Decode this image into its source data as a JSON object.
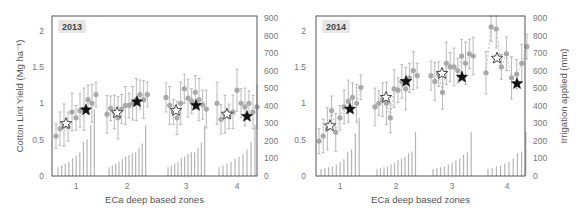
{
  "chart_data": [
    {
      "type": "scatter",
      "title": "2013",
      "xlabel": "ECa deep based zones",
      "ylabel": "Cotton Lint Yield (Mg ha-1)",
      "ylabel_right": "Irrigation applied (mm)",
      "ylim": [
        0,
        2.2
      ],
      "ylim_right": [
        0,
        900
      ],
      "yticks": [
        "0",
        "0.5",
        "1",
        "1.5",
        "2"
      ],
      "yticks_right": [
        "0",
        "100",
        "200",
        "300",
        "400",
        "500",
        "600",
        "700",
        "800",
        "900"
      ],
      "xticks": [
        "1",
        "2",
        "3",
        "4"
      ],
      "grid": false,
      "series": [
        {
          "name": "Yield per irrigation level (mean ± sd)",
          "marker": "circle-grey",
          "zones": [
            {
              "zone": 1,
              "values": [
                0.55,
                0.65,
                0.7,
                0.68,
                0.88,
                0.8,
                0.9,
                0.92,
                1.05,
                1.0,
                1.12
              ]
            },
            {
              "zone": 2,
              "values": [
                0.85,
                0.93,
                0.88,
                0.8,
                0.92,
                0.97,
                0.97,
                1.0,
                1.05,
                1.12,
                1.05,
                1.12
              ]
            },
            {
              "zone": 3,
              "values": [
                1.08,
                0.97,
                0.88,
                0.8,
                1.0,
                1.2,
                1.07,
                1.03,
                1.15,
                1.05,
                0.98,
                0.92
              ]
            },
            {
              "zone": 4,
              "values": [
                1.0,
                0.78,
                0.85,
                0.82,
                0.88,
                1.18,
                1.0,
                0.95,
                1.0,
                0.88,
                0.95
              ]
            }
          ]
        },
        {
          "name": "Uniform irrigation (open star)",
          "marker": "star-open",
          "points": [
            {
              "zone": 1,
              "y": 0.72
            },
            {
              "zone": 2,
              "y": 0.87
            },
            {
              "zone": 3,
              "y": 0.9
            },
            {
              "zone": 4,
              "y": 0.85
            }
          ]
        },
        {
          "name": "Variable rate irrigation (filled star)",
          "marker": "star-filled",
          "points": [
            {
              "zone": 1,
              "y": 0.91
            },
            {
              "zone": 2,
              "y": 1.02
            },
            {
              "zone": 3,
              "y": 0.97
            },
            {
              "zone": 4,
              "y": 0.82
            }
          ]
        },
        {
          "name": "Irrigation applied (mm)",
          "marker": "bar-right-axis",
          "zones": [
            {
              "zone": 1,
              "values": [
                50,
                60,
                70,
                80,
                100,
                115,
                135,
                195,
                210,
                290,
                380
              ]
            },
            {
              "zone": 2,
              "values": [
                50,
                60,
                70,
                80,
                95,
                110,
                120,
                130,
                135,
                160,
                185,
                290
              ]
            },
            {
              "zone": 3,
              "values": [
                50,
                60,
                70,
                80,
                100,
                110,
                125,
                135,
                135,
                160,
                190,
                285
              ]
            },
            {
              "zone": 4,
              "values": [
                50,
                60,
                70,
                80,
                100,
                110,
                125,
                150,
                195,
                290
              ]
            }
          ]
        }
      ]
    },
    {
      "type": "scatter",
      "title": "2014",
      "xlabel": "ECa deep based zones",
      "ylabel": "Cotton Lint Yield (Mg ha-1)",
      "ylabel_right": "Irrigation applied (mm)",
      "ylim": [
        0,
        2.2
      ],
      "ylim_right": [
        0,
        900
      ],
      "yticks": [
        "0",
        "0.5",
        "1",
        "1.5",
        "2"
      ],
      "yticks_right": [
        "0",
        "100",
        "200",
        "300",
        "400",
        "500",
        "600",
        "700",
        "800",
        "900"
      ],
      "xticks": [
        "1",
        "2",
        "3",
        "4"
      ],
      "grid": false,
      "series": [
        {
          "name": "Yield per irrigation level (mean ± sd)",
          "marker": "circle-grey",
          "zones": [
            {
              "zone": 1,
              "values": [
                0.48,
                0.55,
                0.65,
                0.9,
                0.6,
                0.8,
                0.95,
                1.03,
                1.08,
                1.0,
                1.22
              ]
            },
            {
              "zone": 2,
              "values": [
                0.95,
                1.0,
                1.05,
                1.0,
                0.8,
                1.2,
                1.18,
                1.3,
                1.2,
                1.35,
                1.45,
                1.38
              ]
            },
            {
              "zone": 3,
              "values": [
                1.38,
                1.3,
                1.4,
                1.15,
                1.55,
                1.5,
                1.5,
                1.45,
                1.65,
                1.55,
                1.68,
                1.65
              ]
            },
            {
              "zone": 4,
              "values": [
                1.42,
                2.05,
                2.02,
                1.5,
                1.68,
                1.35,
                1.4,
                1.55,
                1.78
              ]
            }
          ]
        },
        {
          "name": "Uniform irrigation (open star)",
          "marker": "star-open",
          "points": [
            {
              "zone": 1,
              "y": 0.69
            },
            {
              "zone": 2,
              "y": 1.08
            },
            {
              "zone": 3,
              "y": 1.41
            },
            {
              "zone": 4,
              "y": 1.62
            }
          ]
        },
        {
          "name": "Variable rate irrigation (filled star)",
          "marker": "star-filled",
          "points": [
            {
              "zone": 1,
              "y": 0.92
            },
            {
              "zone": 2,
              "y": 1.3
            },
            {
              "zone": 3,
              "y": 1.36
            },
            {
              "zone": 4,
              "y": 1.27
            }
          ]
        },
        {
          "name": "Irrigation applied (mm)",
          "marker": "bar-right-axis",
          "zones": [
            {
              "zone": 1,
              "values": [
                40,
                45,
                50,
                55,
                65,
                80,
                95,
                135,
                150,
                240,
                330
              ]
            },
            {
              "zone": 2,
              "values": [
                40,
                45,
                50,
                55,
                65,
                75,
                90,
                100,
                110,
                130,
                140,
                250
              ]
            },
            {
              "zone": 3,
              "values": [
                40,
                45,
                50,
                55,
                65,
                75,
                90,
                100,
                120,
                135,
                250
              ]
            },
            {
              "zone": 4,
              "values": [
                40,
                45,
                55,
                60,
                70,
                80,
                100,
                130,
                140,
                250
              ]
            }
          ]
        }
      ]
    }
  ],
  "labels": {
    "panel_left_tag": "2013",
    "panel_right_tag": "2014",
    "xlabel_left": "ECa deep based zones",
    "xlabel_right": "ECa deep based zones",
    "ylabel_left": "Cotton Lint Yield (Mg ha⁻¹)",
    "ylabel_right": "Irrigation applied (mm)"
  }
}
